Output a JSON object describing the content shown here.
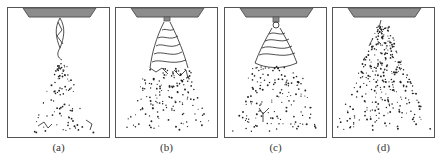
{
  "figure": {
    "panels": [
      {
        "id": "a",
        "label": "(a)",
        "pattern": "narrow liquid sheet breaking into sparse droplets"
      },
      {
        "id": "b",
        "label": "(b)",
        "pattern": "wavy conical sheet with ligaments and droplets"
      },
      {
        "id": "c",
        "label": "(c)",
        "pattern": "tulip-shaped sheet breaking into droplet clusters"
      },
      {
        "id": "d",
        "label": "(d)",
        "pattern": "fully atomized conical droplet spray"
      }
    ],
    "colors": {
      "nozzle_fill": "#8c8c8c",
      "nozzle_stroke": "#555555",
      "frame": "#555555",
      "spray": "#222222"
    }
  }
}
